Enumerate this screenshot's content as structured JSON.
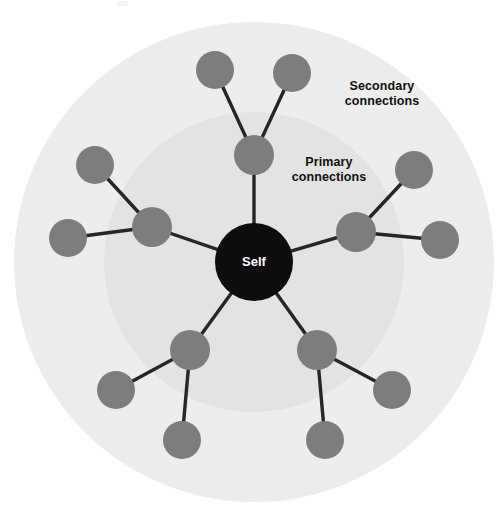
{
  "diagram": {
    "type": "radial-network",
    "title_center": "Self",
    "background_color": "#ffffff",
    "rings": [
      {
        "name": "secondary-ring",
        "label": "Secondary\nconnections",
        "label_line1": "Secondary",
        "label_line2": "connections",
        "color": "#ededed",
        "center_x": 254,
        "center_y": 262,
        "radius": 240
      },
      {
        "name": "primary-ring",
        "label": "Primary\nconnections",
        "label_line1": "Primary",
        "label_line2": "connections",
        "color": "#e3e3e3",
        "center_x": 254,
        "center_y": 262,
        "radius": 150
      }
    ],
    "center_node": {
      "label": "Self",
      "color": "#0d0d0d",
      "text_color": "#ffffff",
      "x": 254,
      "y": 262,
      "r": 39
    },
    "node_style": {
      "primary_color": "#7d7d7d",
      "secondary_color": "#7d7d7d",
      "edge_color": "#262626",
      "primary_radius": 20,
      "secondary_radius": 19
    },
    "primary_nodes": [
      {
        "id": "p-top",
        "x": 254,
        "y": 155,
        "r": 20
      },
      {
        "id": "p-left",
        "x": 152,
        "y": 227,
        "r": 20
      },
      {
        "id": "p-right",
        "x": 356,
        "y": 232,
        "r": 20
      },
      {
        "id": "p-bottom-left",
        "x": 190,
        "y": 350,
        "r": 20
      },
      {
        "id": "p-bottom-right",
        "x": 317,
        "y": 350,
        "r": 20
      }
    ],
    "secondary_nodes": [
      {
        "id": "s-top-left",
        "parent": "p-top",
        "x": 215,
        "y": 70,
        "r": 19
      },
      {
        "id": "s-top-right",
        "parent": "p-top",
        "x": 292,
        "y": 73,
        "r": 19
      },
      {
        "id": "s-left-upper",
        "parent": "p-left",
        "x": 95,
        "y": 165,
        "r": 19
      },
      {
        "id": "s-left-lower",
        "parent": "p-left",
        "x": 68,
        "y": 238,
        "r": 19
      },
      {
        "id": "s-right-upper",
        "parent": "p-right",
        "x": 414,
        "y": 170,
        "r": 19
      },
      {
        "id": "s-right-lower",
        "parent": "p-right",
        "x": 440,
        "y": 240,
        "r": 19
      },
      {
        "id": "s-bl-outer",
        "parent": "p-bottom-left",
        "x": 116,
        "y": 390,
        "r": 19
      },
      {
        "id": "s-bl-bottom",
        "parent": "p-bottom-left",
        "x": 182,
        "y": 440,
        "r": 19
      },
      {
        "id": "s-br-outer",
        "parent": "p-bottom-right",
        "x": 392,
        "y": 390,
        "r": 19
      },
      {
        "id": "s-br-bottom",
        "parent": "p-bottom-right",
        "x": 325,
        "y": 440,
        "r": 19
      }
    ],
    "edges_hub": [
      {
        "from": "center",
        "to": "p-top"
      },
      {
        "from": "center",
        "to": "p-left"
      },
      {
        "from": "center",
        "to": "p-right"
      },
      {
        "from": "center",
        "to": "p-bottom-left"
      },
      {
        "from": "center",
        "to": "p-bottom-right"
      }
    ],
    "counts": {
      "primary": 5,
      "secondary": 10
    }
  }
}
